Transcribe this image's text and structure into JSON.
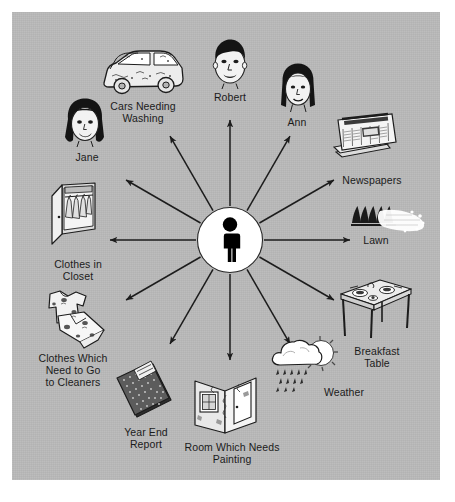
{
  "diagram": {
    "type": "radial-spoke",
    "title": "",
    "center": {
      "label": "",
      "icon": "person-figure-icon",
      "shape": "circle",
      "fill_color": "#ffffff",
      "figure_color": "#000000",
      "cx": 230,
      "cy": 240,
      "r": 32
    },
    "background": {
      "page_color": "#ffffff",
      "panel_color": "#b9b9b9",
      "panel": {
        "x": 12,
        "y": 12,
        "w": 428,
        "h": 468
      }
    },
    "arrow": {
      "color": "#1c1c1c",
      "count": 12,
      "angle_step_deg": 30,
      "inner_radius": 34,
      "outer_radius": 120
    },
    "nodes": [
      {
        "id": "robert",
        "label": "Robert",
        "icon": "boy-face-icon",
        "angle_deg": -90,
        "label_x": 198,
        "label_y": 91,
        "label_w": 64,
        "icon_x": 206,
        "icon_y": 37,
        "icon_w": 48,
        "icon_h": 52
      },
      {
        "id": "ann",
        "label": "Ann",
        "icon": "girl-face-icon",
        "angle_deg": -60,
        "label_x": 268,
        "label_y": 116,
        "label_w": 58,
        "icon_x": 277,
        "icon_y": 62,
        "icon_w": 42,
        "icon_h": 52
      },
      {
        "id": "newspapers",
        "label": "Newspapers",
        "icon": "newspaper-stack-icon",
        "angle_deg": -30,
        "label_x": 329,
        "label_y": 174,
        "label_w": 86,
        "icon_x": 330,
        "icon_y": 112,
        "icon_w": 70,
        "icon_h": 60
      },
      {
        "id": "lawn",
        "label": "Lawn",
        "icon": "lawn-sprinkler-icon",
        "angle_deg": 0,
        "label_x": 348,
        "label_y": 234,
        "label_w": 56,
        "icon_x": 350,
        "icon_y": 203,
        "icon_w": 76,
        "icon_h": 30
      },
      {
        "id": "breakfast-table",
        "label": "Breakfast\nTable",
        "icon": "breakfast-table-icon",
        "angle_deg": 30,
        "label_x": 340,
        "label_y": 345,
        "label_w": 74,
        "icon_x": 338,
        "icon_y": 278,
        "icon_w": 76,
        "icon_h": 62
      },
      {
        "id": "weather",
        "label": "Weather",
        "icon": "sun-cloud-rain-icon",
        "angle_deg": 60,
        "label_x": 310,
        "label_y": 386,
        "label_w": 68,
        "icon_x": 270,
        "icon_y": 338,
        "icon_w": 68,
        "icon_h": 58
      },
      {
        "id": "room-painting",
        "label": "Room Which Needs\nPainting",
        "icon": "room-corner-icon",
        "angle_deg": 90,
        "label_x": 168,
        "label_y": 441,
        "label_w": 128,
        "icon_x": 193,
        "icon_y": 375,
        "icon_w": 66,
        "icon_h": 64
      },
      {
        "id": "year-end-report",
        "label": "Year End\nReport",
        "icon": "report-book-icon",
        "angle_deg": 120,
        "label_x": 110,
        "label_y": 426,
        "label_w": 72,
        "icon_x": 115,
        "icon_y": 362,
        "icon_w": 60,
        "icon_h": 60
      },
      {
        "id": "clothes-cleaners",
        "label": "Clothes Which\nNeed to Go\nto Cleaners",
        "icon": "dirty-clothes-icon",
        "angle_deg": 150,
        "label_x": 27,
        "label_y": 352,
        "label_w": 92,
        "icon_x": 40,
        "icon_y": 290,
        "icon_w": 72,
        "icon_h": 60
      },
      {
        "id": "clothes-closet",
        "label": "Clothes in\nCloset",
        "icon": "closet-icon",
        "angle_deg": 180,
        "label_x": 38,
        "label_y": 258,
        "label_w": 80,
        "icon_x": 50,
        "icon_y": 182,
        "icon_w": 56,
        "icon_h": 72
      },
      {
        "id": "jane",
        "label": "Jane",
        "icon": "woman-face-icon",
        "angle_deg": -150,
        "label_x": 58,
        "label_y": 151,
        "label_w": 58,
        "icon_x": 62,
        "icon_y": 97,
        "icon_w": 48,
        "icon_h": 52
      },
      {
        "id": "cars-washing",
        "label": "Cars Needing\nWashing",
        "icon": "dirty-car-icon",
        "angle_deg": -120,
        "label_x": 99,
        "label_y": 100,
        "label_w": 88,
        "icon_x": 98,
        "icon_y": 43,
        "icon_w": 88,
        "icon_h": 54
      }
    ]
  }
}
